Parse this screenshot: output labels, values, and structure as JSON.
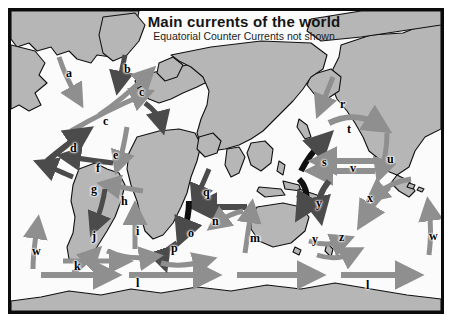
{
  "map": {
    "title": "Main currents of the world",
    "subtitle": "Equatorial Counter Currents not shown",
    "colors": {
      "land_fill": "#b6b6b6",
      "land_stroke": "#101010",
      "ocean_fill": "#fbfbfb",
      "warm_current": "#8f8f8f",
      "cold_current": "#4b4b4b",
      "frame": "#0b0b0b",
      "label_text": "#000000"
    },
    "labels": [
      {
        "id": "a",
        "text": "a",
        "x": 55,
        "y": 56,
        "region": "north-atlantic-west"
      },
      {
        "id": "b",
        "text": "b",
        "x": 113,
        "y": 52,
        "region": "greenland-east"
      },
      {
        "id": "c1",
        "text": "c",
        "x": 128,
        "y": 75,
        "region": "norwegian-sea"
      },
      {
        "id": "c2",
        "text": "c",
        "x": 92,
        "y": 104,
        "region": "north-atlantic-drift"
      },
      {
        "id": "d",
        "text": "d",
        "x": 59,
        "y": 131,
        "region": "north-atlantic-gulf"
      },
      {
        "id": "e",
        "text": "e",
        "x": 102,
        "y": 138,
        "region": "canary"
      },
      {
        "id": "f",
        "text": "f",
        "x": 85,
        "y": 151,
        "region": "north-equatorial-atlantic"
      },
      {
        "id": "g",
        "text": "g",
        "x": 80,
        "y": 172,
        "region": "caribbean"
      },
      {
        "id": "h",
        "text": "h",
        "x": 110,
        "y": 184,
        "region": "south-equatorial-atlantic"
      },
      {
        "id": "i",
        "text": "i",
        "x": 125,
        "y": 214,
        "region": "benguela"
      },
      {
        "id": "j",
        "text": "j",
        "x": 81,
        "y": 219,
        "region": "brazil"
      },
      {
        "id": "k",
        "text": "k",
        "x": 63,
        "y": 249,
        "region": "falkland"
      },
      {
        "id": "l1",
        "text": "l",
        "x": 125,
        "y": 266,
        "region": "antarctic-circumpolar-west"
      },
      {
        "id": "l2",
        "text": "l",
        "x": 355,
        "y": 268,
        "region": "antarctic-circumpolar-east"
      },
      {
        "id": "m",
        "text": "m",
        "x": 239,
        "y": 221,
        "region": "west-australian"
      },
      {
        "id": "n",
        "text": "n",
        "x": 201,
        "y": 204,
        "region": "north-equatorial-indian"
      },
      {
        "id": "o",
        "text": "o",
        "x": 177,
        "y": 216,
        "region": "madagascar"
      },
      {
        "id": "p",
        "text": "p",
        "x": 160,
        "y": 231,
        "region": "agulhas"
      },
      {
        "id": "q",
        "text": "q",
        "x": 192,
        "y": 175,
        "region": "somali-monsoon"
      },
      {
        "id": "r",
        "text": "r",
        "x": 329,
        "y": 87,
        "region": "bering"
      },
      {
        "id": "s",
        "text": "s",
        "x": 311,
        "y": 145,
        "region": "kuroshio"
      },
      {
        "id": "t",
        "text": "t",
        "x": 336,
        "y": 112,
        "region": "north-pacific"
      },
      {
        "id": "u",
        "text": "u",
        "x": 376,
        "y": 142,
        "region": "california"
      },
      {
        "id": "v",
        "text": "v",
        "x": 339,
        "y": 151,
        "region": "north-equatorial-pacific"
      },
      {
        "id": "w1",
        "text": "w",
        "x": 21,
        "y": 234,
        "region": "peru-humboldt-west"
      },
      {
        "id": "w2",
        "text": "w",
        "x": 418,
        "y": 219,
        "region": "peru-humboldt-east"
      },
      {
        "id": "x",
        "text": "x",
        "x": 356,
        "y": 181,
        "region": "south-equatorial-pacific"
      },
      {
        "id": "y1",
        "text": "y",
        "x": 305,
        "y": 186,
        "region": "east-australian-north"
      },
      {
        "id": "y2",
        "text": "y",
        "x": 301,
        "y": 222,
        "region": "east-australian-south"
      },
      {
        "id": "z",
        "text": "z",
        "x": 328,
        "y": 220,
        "region": "south-pacific-return"
      }
    ]
  }
}
